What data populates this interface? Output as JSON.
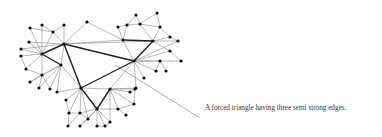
{
  "figure": {
    "caption": "A forced triangle having three semi strong edges.",
    "edge_colors": {
      "weak": "#888888",
      "strong": "#222222",
      "pointer": "#777777"
    },
    "node_color": "#111111",
    "nodes": [
      [
        64,
        44
      ],
      [
        81,
        88
      ],
      [
        134,
        61
      ],
      [
        42,
        54
      ],
      [
        61,
        65
      ],
      [
        123,
        40
      ],
      [
        153,
        41
      ],
      [
        97,
        109
      ],
      [
        110,
        89
      ],
      [
        30,
        28
      ],
      [
        42,
        25
      ],
      [
        64,
        25
      ],
      [
        53,
        32
      ],
      [
        29,
        42
      ],
      [
        21,
        49
      ],
      [
        21,
        56
      ],
      [
        26,
        69
      ],
      [
        42,
        75
      ],
      [
        30,
        82
      ],
      [
        39,
        88
      ],
      [
        50,
        89
      ],
      [
        57,
        92
      ],
      [
        87,
        22
      ],
      [
        136,
        15
      ],
      [
        157,
        13
      ],
      [
        118,
        27
      ],
      [
        127,
        25
      ],
      [
        140,
        24
      ],
      [
        160,
        27
      ],
      [
        170,
        37
      ],
      [
        178,
        41
      ],
      [
        170,
        51
      ],
      [
        181,
        61
      ],
      [
        160,
        61
      ],
      [
        156,
        71
      ],
      [
        166,
        71
      ],
      [
        144,
        78
      ],
      [
        136,
        88
      ],
      [
        130,
        92
      ],
      [
        66,
        100
      ],
      [
        69,
        113
      ],
      [
        80,
        113
      ],
      [
        88,
        119
      ],
      [
        80,
        126
      ],
      [
        68,
        126
      ],
      [
        97,
        126
      ],
      [
        105,
        126
      ],
      [
        110,
        122
      ],
      [
        118,
        109
      ],
      [
        126,
        115
      ],
      [
        134,
        104
      ],
      [
        135,
        89
      ]
    ],
    "strong_edges": [
      [
        0,
        3
      ],
      [
        0,
        2
      ],
      [
        0,
        1
      ],
      [
        1,
        2
      ],
      [
        3,
        4
      ],
      [
        1,
        7
      ],
      [
        7,
        8
      ],
      [
        5,
        6
      ],
      [
        6,
        2
      ]
    ],
    "weak_edges": [
      [
        0,
        11
      ],
      [
        0,
        12
      ],
      [
        0,
        22
      ],
      [
        22,
        5
      ],
      [
        0,
        5
      ],
      [
        0,
        6
      ],
      [
        0,
        13
      ],
      [
        0,
        14
      ],
      [
        9,
        12
      ],
      [
        10,
        12
      ],
      [
        11,
        12
      ],
      [
        9,
        3
      ],
      [
        13,
        3
      ],
      [
        14,
        3
      ],
      [
        15,
        3
      ],
      [
        15,
        16
      ],
      [
        3,
        16
      ],
      [
        3,
        17
      ],
      [
        16,
        17
      ],
      [
        17,
        18
      ],
      [
        17,
        19
      ],
      [
        17,
        20
      ],
      [
        4,
        18
      ],
      [
        4,
        19
      ],
      [
        4,
        20
      ],
      [
        4,
        21
      ],
      [
        4,
        17
      ],
      [
        3,
        12
      ],
      [
        10,
        3
      ],
      [
        0,
        4
      ],
      [
        4,
        1
      ],
      [
        0,
        1
      ],
      [
        3,
        0
      ],
      [
        5,
        25
      ],
      [
        5,
        26
      ],
      [
        25,
        26
      ],
      [
        26,
        23
      ],
      [
        23,
        27
      ],
      [
        27,
        24
      ],
      [
        24,
        28
      ],
      [
        27,
        28
      ],
      [
        26,
        27
      ],
      [
        6,
        27
      ],
      [
        6,
        28
      ],
      [
        6,
        29
      ],
      [
        6,
        30
      ],
      [
        29,
        30
      ],
      [
        28,
        29
      ],
      [
        6,
        31
      ],
      [
        31,
        32
      ],
      [
        2,
        31
      ],
      [
        2,
        32
      ],
      [
        2,
        33
      ],
      [
        33,
        34
      ],
      [
        33,
        35
      ],
      [
        2,
        34
      ],
      [
        2,
        36
      ],
      [
        2,
        8
      ],
      [
        2,
        37
      ],
      [
        5,
        2
      ],
      [
        2,
        30
      ],
      [
        1,
        39
      ],
      [
        1,
        40
      ],
      [
        1,
        41
      ],
      [
        1,
        42
      ],
      [
        39,
        40
      ],
      [
        40,
        41
      ],
      [
        41,
        42
      ],
      [
        42,
        43
      ],
      [
        41,
        44
      ],
      [
        40,
        44
      ],
      [
        7,
        42
      ],
      [
        7,
        43
      ],
      [
        7,
        45
      ],
      [
        7,
        46
      ],
      [
        7,
        47
      ],
      [
        8,
        47
      ],
      [
        7,
        48
      ],
      [
        48,
        49
      ],
      [
        8,
        48
      ],
      [
        8,
        50
      ],
      [
        48,
        50
      ],
      [
        8,
        38
      ],
      [
        8,
        51
      ],
      [
        38,
        51
      ],
      [
        1,
        21
      ],
      [
        1,
        8
      ],
      [
        8,
        37
      ],
      [
        7,
        41
      ],
      [
        46,
        47
      ],
      [
        45,
        46
      ],
      [
        50,
        51
      ]
    ],
    "pointer_line": [
      115,
      65,
      200,
      118
    ]
  }
}
